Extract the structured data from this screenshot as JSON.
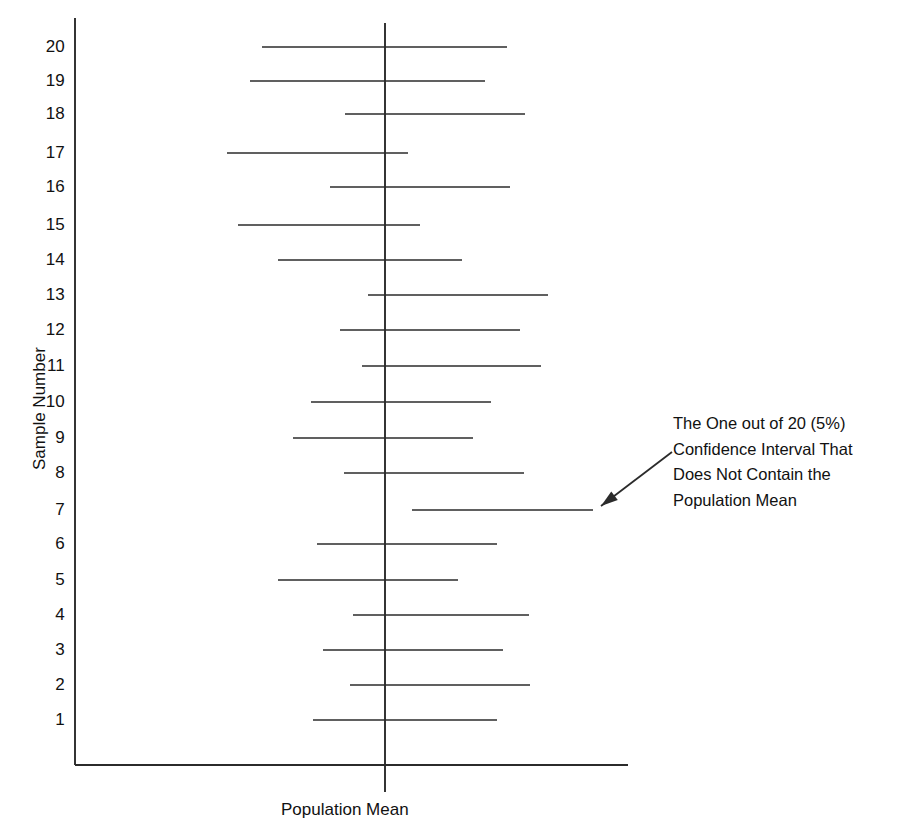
{
  "figure": {
    "width": 914,
    "height": 828,
    "background": "#ffffff",
    "line_color": "#2b2b2b",
    "text_color": "#111111"
  },
  "axes": {
    "y_title": "Sample Number",
    "x_title": "Population Mean",
    "y_axis_x": 75,
    "y_axis_top": 18,
    "x_axis_y": 765,
    "x_axis_left": 75,
    "x_axis_right": 628,
    "mean_line_x": 385,
    "mean_line_top": 23,
    "mean_line_bottom": 792,
    "tick_labels": [
      "20",
      "19",
      "18",
      "17",
      "16",
      "15",
      "14",
      "13",
      "12",
      "11",
      "10",
      "9",
      "8",
      "7",
      "6",
      "5",
      "4",
      "3",
      "2",
      "1"
    ]
  },
  "annotation": {
    "lines": [
      "The One out of 20 (5%)",
      "Confidence Interval That",
      "Does Not Contain the",
      "Population Mean"
    ],
    "text_x": 673,
    "text_y": 411,
    "arrow_tail_x": 672,
    "arrow_tail_y": 452,
    "arrow_head_x": 601,
    "arrow_head_y": 506,
    "points_at_sample": 7
  },
  "chart_data": {
    "type": "line",
    "title": "",
    "subtitle": "",
    "xlabel": "Population Mean",
    "ylabel": "Sample Number",
    "grid": false,
    "legend": "none",
    "orientation": "horizontal",
    "reference_line": {
      "label": "Population Mean",
      "pixel_x": 385,
      "orientation": "vertical"
    },
    "ylim": [
      0.4,
      20.6
    ],
    "categories": [
      1,
      2,
      3,
      4,
      5,
      6,
      7,
      8,
      9,
      10,
      11,
      12,
      13,
      14,
      15,
      16,
      17,
      18,
      19,
      20
    ],
    "intervals": [
      {
        "sample": 20,
        "left_px": 262,
        "right_px": 507,
        "y_px": 47,
        "contains_mean": true
      },
      {
        "sample": 19,
        "left_px": 250,
        "right_px": 485,
        "y_px": 81,
        "contains_mean": true
      },
      {
        "sample": 18,
        "left_px": 345,
        "right_px": 525,
        "y_px": 114,
        "contains_mean": true
      },
      {
        "sample": 17,
        "left_px": 227,
        "right_px": 408,
        "y_px": 153,
        "contains_mean": true
      },
      {
        "sample": 16,
        "left_px": 330,
        "right_px": 510,
        "y_px": 187,
        "contains_mean": true
      },
      {
        "sample": 15,
        "left_px": 238,
        "right_px": 420,
        "y_px": 225,
        "contains_mean": true
      },
      {
        "sample": 14,
        "left_px": 278,
        "right_px": 462,
        "y_px": 260,
        "contains_mean": true
      },
      {
        "sample": 13,
        "left_px": 368,
        "right_px": 548,
        "y_px": 295,
        "contains_mean": true
      },
      {
        "sample": 12,
        "left_px": 340,
        "right_px": 520,
        "y_px": 330,
        "contains_mean": true
      },
      {
        "sample": 11,
        "left_px": 362,
        "right_px": 541,
        "y_px": 366,
        "contains_mean": true
      },
      {
        "sample": 10,
        "left_px": 311,
        "right_px": 491,
        "y_px": 402,
        "contains_mean": true
      },
      {
        "sample": 9,
        "left_px": 293,
        "right_px": 473,
        "y_px": 438,
        "contains_mean": true
      },
      {
        "sample": 8,
        "left_px": 344,
        "right_px": 524,
        "y_px": 473,
        "contains_mean": true
      },
      {
        "sample": 7,
        "left_px": 412,
        "right_px": 593,
        "y_px": 510,
        "contains_mean": false
      },
      {
        "sample": 6,
        "left_px": 317,
        "right_px": 497,
        "y_px": 544,
        "contains_mean": true
      },
      {
        "sample": 5,
        "left_px": 278,
        "right_px": 458,
        "y_px": 580,
        "contains_mean": true
      },
      {
        "sample": 4,
        "left_px": 353,
        "right_px": 529,
        "y_px": 615,
        "contains_mean": true
      },
      {
        "sample": 3,
        "left_px": 323,
        "right_px": 503,
        "y_px": 650,
        "contains_mean": true
      },
      {
        "sample": 2,
        "left_px": 350,
        "right_px": 530,
        "y_px": 685,
        "contains_mean": true
      },
      {
        "sample": 1,
        "left_px": 313,
        "right_px": 497,
        "y_px": 720,
        "contains_mean": true
      }
    ],
    "summary": {
      "total_intervals": 20,
      "containing_mean": 19,
      "not_containing_mean": 1,
      "miss_rate_percent": 5
    }
  }
}
